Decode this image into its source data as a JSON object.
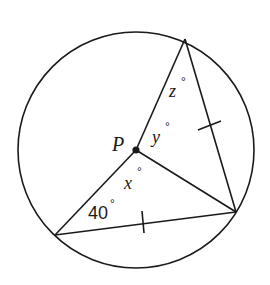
{
  "diagram": {
    "type": "circle-inscribed-triangle-with-center",
    "stroke_color": "#1a1a1a",
    "background": "#ffffff",
    "circle": {
      "cx": 136,
      "cy": 150,
      "r": 118
    },
    "center_point": {
      "label": "P",
      "x": 136,
      "y": 150
    },
    "vertices": {
      "top": {
        "x": 185,
        "y": 39
      },
      "right": {
        "x": 236,
        "y": 212
      },
      "bottom_left": {
        "x": 55,
        "y": 235
      }
    },
    "segments": [
      {
        "from": "top",
        "to": "right",
        "tick": true
      },
      {
        "from": "right",
        "to": "bottom_left",
        "tick": true
      },
      {
        "from": "P",
        "to": "top",
        "tick": false
      },
      {
        "from": "P",
        "to": "right",
        "tick": false
      },
      {
        "from": "P",
        "to": "bottom_left",
        "tick": false
      }
    ],
    "labels": {
      "point_p": "P",
      "angle_z": "z",
      "angle_y": "y",
      "angle_x": "x",
      "angle_40": "40",
      "degree": "°"
    }
  }
}
